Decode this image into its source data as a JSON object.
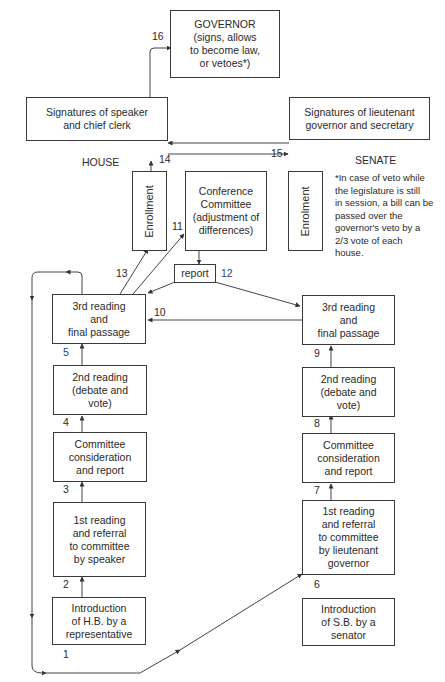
{
  "diagram": {
    "chambers": {
      "house": "HOUSE",
      "senate": "SENATE"
    },
    "boxes": {
      "governor": "GOVERNOR\n(signs, allows\nto become law,\nor vetoes*)",
      "house_signatures": "Signatures of speaker\nand chief clerk",
      "senate_signatures": "Signatures of lieutenant\ngovernor and secretary",
      "house_enrollment": "Enrollment",
      "conference_committee": "Conference\nCommittee\n(adjustment of\ndifferences)",
      "senate_enrollment": "Enrolment",
      "report": "report",
      "house_third_reading": "3rd reading\nand\nfinal passage",
      "senate_third_reading": "3rd reading\nand\nfinal passage",
      "house_second_reading": "2nd reading\n(debate and\nvote)",
      "senate_second_reading": "2nd reading\n(debate and\nvote)",
      "house_committee": "Committee\nconsideration\nand report",
      "senate_committee": "Committee\nconsideration\nand report",
      "house_first_reading": "1st reading\nand referral\nto committee\nby speaker",
      "senate_first_reading": "1st reading\nand referral\nto committee\nby lieutenant\ngovernor",
      "house_introduction": "Introduction\nof H.B. by a\nrepresentative",
      "senate_introduction": "Introduction\nof S.B. by a\nsenator"
    },
    "step_numbers": {
      "s1": "1",
      "s2": "2",
      "s3": "3",
      "s4": "4",
      "s5": "5",
      "s6": "6",
      "s7": "7",
      "s8": "8",
      "s9": "9",
      "s10": "10",
      "s11": "11",
      "s12": "12",
      "s13": "13",
      "s14": "14",
      "s15": "15",
      "s16": "16"
    },
    "footnote": "*In case of veto while\nthe legislature is still\nin session, a bill can be\npassed over the\ngovernor's veto by a\n2/3 vote of each\nhouse."
  }
}
